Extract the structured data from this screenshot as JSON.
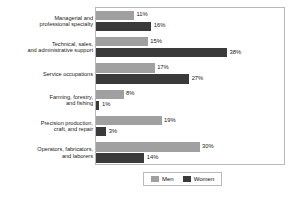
{
  "chart_data": {
    "type": "bar",
    "orientation": "horizontal",
    "title": "",
    "subtitle": "",
    "xlabel": "",
    "ylabel": "",
    "xlim": [
      0,
      40
    ],
    "grid": false,
    "legend_position": "bottom",
    "value_suffix": "%",
    "categories": [
      "Managerial and professional specialty",
      "Technical, sales, and administrative support",
      "Service occupations",
      "Farming, forestry, and fishing",
      "Precision production, craft, and repair",
      "Operators, fabricators, and laborers"
    ],
    "category_lines": [
      [
        "Managerial and",
        "professional specialty"
      ],
      [
        "Technical, sales,",
        "and administrative support"
      ],
      [
        "Service occupations"
      ],
      [
        "Farming, forestry,",
        "and fishing"
      ],
      [
        "Precision production,",
        "craft, and repair"
      ],
      [
        "Operators, fabricators,",
        "and laborers"
      ]
    ],
    "series": [
      {
        "name": "Men",
        "color": "#a0a0a0",
        "values": [
          11,
          15,
          17,
          8,
          19,
          30
        ],
        "labels": [
          "11%",
          "15%",
          "17%",
          "8%",
          "19%",
          "30%"
        ]
      },
      {
        "name": "Women",
        "color": "#3a3a3a",
        "values": [
          16,
          38,
          27,
          1,
          3,
          14
        ],
        "labels": [
          "16%",
          "38%",
          "27%",
          "1%",
          "3%",
          "14%"
        ]
      }
    ]
  },
  "legend": {
    "items": [
      {
        "label": "Men",
        "color": "#a0a0a0"
      },
      {
        "label": "Women",
        "color": "#3a3a3a"
      }
    ]
  }
}
